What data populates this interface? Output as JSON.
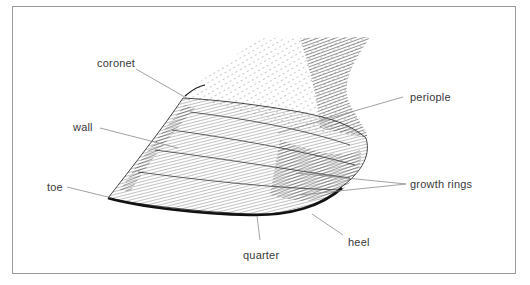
{
  "figure": {
    "labels": {
      "coronet": "coronet",
      "wall": "wall",
      "toe": "toe",
      "periople": "periople",
      "growth_rings": "growth rings",
      "heel": "heel",
      "quarter": "quarter"
    },
    "colors": {
      "ink": "#1a1a1a",
      "leader_line": "#8a8a8a",
      "label_text": "#3a3a3a",
      "border": "#9a9a9a",
      "background": "#ffffff"
    }
  }
}
